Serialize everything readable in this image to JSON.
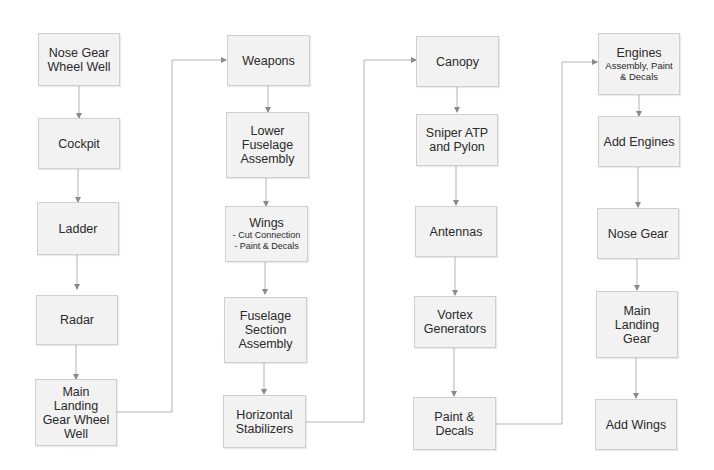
{
  "diagram": {
    "type": "flowchart",
    "colors": {
      "node_fill": "#f2f2f2",
      "node_border": "#cfcfcf",
      "connector": "#b4b4b4",
      "text": "#2a2a2a"
    },
    "columns": [
      {
        "nodes": [
          {
            "id": "n1",
            "title": "Nose Gear Wheel Well"
          },
          {
            "id": "n2",
            "title": "Cockpit"
          },
          {
            "id": "n3",
            "title": "Ladder"
          },
          {
            "id": "n4",
            "title": "Radar"
          },
          {
            "id": "n5",
            "title": "Main Landing Gear Wheel Well"
          }
        ]
      },
      {
        "nodes": [
          {
            "id": "n6",
            "title": "Weapons"
          },
          {
            "id": "n7",
            "title": "Lower Fuselage Assembly"
          },
          {
            "id": "n8",
            "title": "Wings",
            "details": [
              "- Cut Connection",
              "- Paint & Decals"
            ]
          },
          {
            "id": "n9",
            "title": "Fuselage Section Assembly"
          },
          {
            "id": "n10",
            "title": "Horizontal Stabilizers"
          }
        ]
      },
      {
        "nodes": [
          {
            "id": "n11",
            "title": "Canopy"
          },
          {
            "id": "n12",
            "title": "Sniper ATP and Pylon"
          },
          {
            "id": "n13",
            "title": "Antennas"
          },
          {
            "id": "n14",
            "title": "Vortex Generators"
          },
          {
            "id": "n15",
            "title": "Paint & Decals"
          }
        ]
      },
      {
        "nodes": [
          {
            "id": "n16",
            "title": "Engines",
            "subtitle": "Assembly, Paint & Decals"
          },
          {
            "id": "n17",
            "title": "Add Engines"
          },
          {
            "id": "n18",
            "title": "Nose Gear"
          },
          {
            "id": "n19",
            "title": "Main Landing Gear"
          },
          {
            "id": "n20",
            "title": "Add Wings"
          }
        ]
      }
    ],
    "edges": [
      [
        "n1",
        "n2"
      ],
      [
        "n2",
        "n3"
      ],
      [
        "n3",
        "n4"
      ],
      [
        "n4",
        "n5"
      ],
      [
        "n5",
        "n6"
      ],
      [
        "n6",
        "n7"
      ],
      [
        "n7",
        "n8"
      ],
      [
        "n8",
        "n9"
      ],
      [
        "n9",
        "n10"
      ],
      [
        "n10",
        "n11"
      ],
      [
        "n11",
        "n12"
      ],
      [
        "n12",
        "n13"
      ],
      [
        "n13",
        "n14"
      ],
      [
        "n14",
        "n15"
      ],
      [
        "n15",
        "n16"
      ],
      [
        "n16",
        "n17"
      ],
      [
        "n17",
        "n18"
      ],
      [
        "n18",
        "n19"
      ],
      [
        "n19",
        "n20"
      ]
    ]
  }
}
